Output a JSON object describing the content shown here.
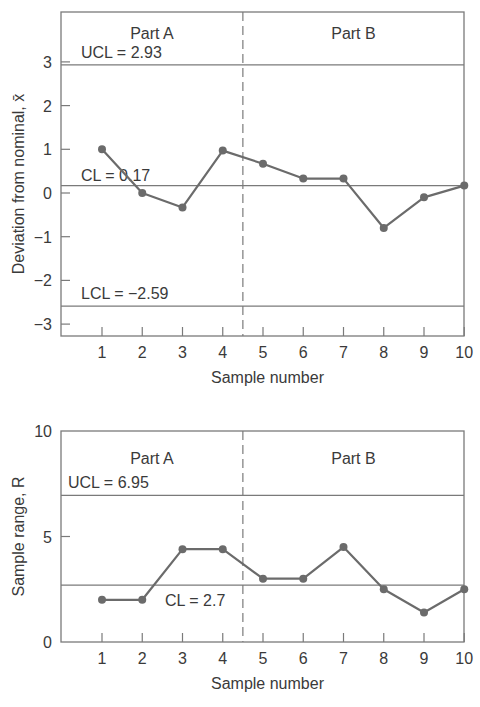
{
  "chart_data": [
    {
      "type": "line",
      "title": "",
      "xlabel": "Sample number",
      "ylabel": "Deviation from nominal, x̄",
      "ylim": [
        -3.3,
        4.1
      ],
      "xlim": [
        0,
        10
      ],
      "x": [
        1,
        2,
        3,
        4,
        5,
        6,
        7,
        8,
        9,
        10
      ],
      "x_ticks": [
        "1",
        "2",
        "3",
        "4",
        "5",
        "6",
        "7",
        "8",
        "9",
        "10"
      ],
      "y_ticks": [
        "3",
        "2",
        "1",
        "0",
        "−1",
        "−2",
        "−3"
      ],
      "y_tick_values": [
        3,
        2,
        1,
        0,
        -1,
        -2,
        -3
      ],
      "series": [
        {
          "name": "x̄",
          "values": [
            1.0,
            0.0,
            -0.33,
            0.97,
            0.67,
            0.33,
            0.33,
            -0.8,
            -0.1,
            0.17
          ]
        }
      ],
      "control_lines": {
        "ucl": {
          "value": 2.93,
          "label": "UCL = 2.93"
        },
        "cl": {
          "value": 0.17,
          "label": "CL = 0.17"
        },
        "lcl": {
          "value": -2.59,
          "label": "LCL = −2.59"
        }
      },
      "regions": [
        {
          "label": "Part A",
          "x_range": [
            0,
            4.5
          ]
        },
        {
          "label": "Part B",
          "x_range": [
            4.5,
            10
          ]
        }
      ],
      "divider_x": 4.5,
      "grid": false,
      "legend": "none"
    },
    {
      "type": "line",
      "title": "",
      "xlabel": "Sample number",
      "ylabel": "Sample range, R",
      "ylim": [
        0,
        10
      ],
      "xlim": [
        0,
        10
      ],
      "x": [
        1,
        2,
        3,
        4,
        5,
        6,
        7,
        8,
        9,
        10
      ],
      "x_ticks": [
        "1",
        "2",
        "3",
        "4",
        "5",
        "6",
        "7",
        "8",
        "9",
        "10"
      ],
      "y_ticks": [
        "10",
        "5",
        "0"
      ],
      "y_tick_values": [
        10,
        5,
        0
      ],
      "series": [
        {
          "name": "R",
          "values": [
            2.0,
            2.0,
            4.4,
            4.4,
            3.0,
            3.0,
            4.5,
            2.5,
            1.4,
            2.5
          ]
        }
      ],
      "control_lines": {
        "ucl": {
          "value": 6.95,
          "label": "UCL = 6.95"
        },
        "cl": {
          "value": 2.7,
          "label": "CL = 2.7"
        }
      },
      "regions": [
        {
          "label": "Part A",
          "x_range": [
            0,
            4.5
          ]
        },
        {
          "label": "Part B",
          "x_range": [
            4.5,
            10
          ]
        }
      ],
      "divider_x": 4.5,
      "grid": false,
      "legend": "none"
    }
  ],
  "style": {
    "line_color": "#6b6b6b",
    "axis_color": "#7a7a7a",
    "text_color": "#3a3a3a"
  }
}
